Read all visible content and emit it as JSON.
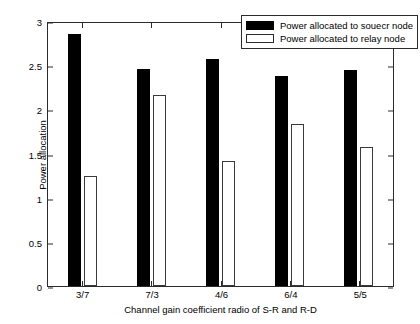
{
  "chart_data": {
    "type": "bar",
    "title": "",
    "xlabel": "Channel gain coefficient radio of S-R and R-D",
    "ylabel": "Power allocation",
    "categories": [
      "3/7",
      "7/3",
      "4/6",
      "6/4",
      "5/5"
    ],
    "series": [
      {
        "name": "Power allocated to souecr node",
        "color": "#000000",
        "style": "filled",
        "values": [
          2.88,
          2.47,
          2.59,
          2.39,
          2.46
        ]
      },
      {
        "name": "Power allocated to relay node",
        "color": "#ffffff",
        "style": "outlined",
        "values": [
          1.25,
          2.18,
          1.43,
          1.85,
          1.59
        ]
      }
    ],
    "ylim": [
      0,
      3
    ],
    "yticks": [
      "0",
      "0.5",
      "1",
      "1.5",
      "2",
      "2.5",
      "3"
    ],
    "ytick_values": [
      0,
      0.5,
      1,
      1.5,
      2,
      2.5,
      3
    ],
    "grid": false,
    "legend_position": "top-right",
    "axis_color": "#2b2b2b",
    "background": "#ffffff"
  }
}
